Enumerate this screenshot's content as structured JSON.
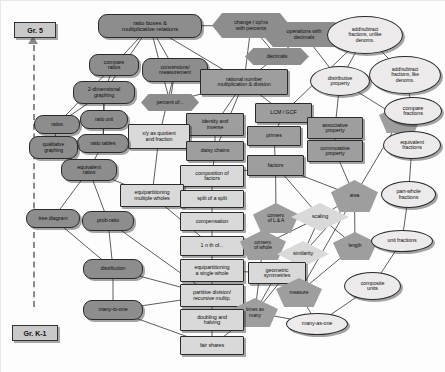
{
  "diagram": {
    "axis": {
      "top_label": "Gr. 5",
      "bottom_label": "Gr. K-1",
      "direction": "upward"
    },
    "colors": {
      "dark_node": "#8d8d8d",
      "mid_node": "#9e9e9e",
      "light_node": "#d9d9d9",
      "pale_node": "#eceaea",
      "edge": "#333333",
      "background": "#fdfdfd"
    },
    "nodes": [
      {
        "id": "ratio-boxes",
        "label": "ratio boxes &\nmultiplicative relations",
        "shape": "round",
        "fill": "dark",
        "x": 98,
        "y": 14,
        "w": 104,
        "h": 24
      },
      {
        "id": "change-ops-percents",
        "label": "change / op'ns\nwith percents",
        "shape": "hex",
        "fill": "dark",
        "x": 212,
        "y": 13,
        "w": 78,
        "h": 25
      },
      {
        "id": "operations-with-decimals",
        "label": "operations with\ndecimals",
        "shape": "hex",
        "fill": "dark",
        "x": 262,
        "y": 22,
        "w": 84,
        "h": 25
      },
      {
        "id": "addsub-unlike",
        "label": "add/subtract\nfractions, unlike\ndenoms.",
        "shape": "oval",
        "fill": "pale",
        "x": 327,
        "y": 16,
        "w": 76,
        "h": 38
      },
      {
        "id": "compare-ratios",
        "label": "compare\nratios",
        "shape": "round",
        "fill": "dark",
        "x": 89,
        "y": 54,
        "w": 50,
        "h": 22
      },
      {
        "id": "conversions-measurement",
        "label": "conversions/\nmeasurement",
        "shape": "round",
        "fill": "dark",
        "x": 142,
        "y": 58,
        "w": 66,
        "h": 24
      },
      {
        "id": "decimals",
        "label": "decimals",
        "shape": "hex",
        "fill": "dark",
        "x": 245,
        "y": 48,
        "w": 64,
        "h": 17
      },
      {
        "id": "addsub-like",
        "label": "add/subtract\nfractions, like\ndenoms.",
        "shape": "oval",
        "fill": "pale",
        "x": 369,
        "y": 56,
        "w": 72,
        "h": 38
      },
      {
        "id": "2d-graphing",
        "label": "2-dimensional\ngraphing",
        "shape": "round",
        "fill": "dark",
        "x": 73,
        "y": 81,
        "w": 62,
        "h": 23
      },
      {
        "id": "percent-of",
        "label": "percent of...",
        "shape": "hex",
        "fill": "dark",
        "x": 141,
        "y": 94,
        "w": 58,
        "h": 17
      },
      {
        "id": "rational-number-mult-div",
        "label": "rational number\nmultiplication & division",
        "shape": "rect",
        "fill": "mid",
        "x": 200,
        "y": 69,
        "w": 88,
        "h": 26
      },
      {
        "id": "distributive-property",
        "label": "distributive\nproperty",
        "shape": "oval",
        "fill": "pale",
        "x": 310,
        "y": 66,
        "w": 60,
        "h": 30
      },
      {
        "id": "ratios",
        "label": "ratios",
        "shape": "round",
        "fill": "dark",
        "x": 34,
        "y": 115,
        "w": 46,
        "h": 19
      },
      {
        "id": "ratio-unit",
        "label": "ratio unit",
        "shape": "round",
        "fill": "dark",
        "x": 80,
        "y": 110,
        "w": 48,
        "h": 19
      },
      {
        "id": "identity-and-inverse",
        "label": "identity and\ninverse",
        "shape": "rect",
        "fill": "mid",
        "x": 186,
        "y": 113,
        "w": 58,
        "h": 23
      },
      {
        "id": "lcm-gcf",
        "label": "LCM / GCF",
        "shape": "rect",
        "fill": "mid",
        "x": 255,
        "y": 103,
        "w": 57,
        "h": 20
      },
      {
        "id": "volume",
        "label": "volume",
        "shape": "pent",
        "fill": "mid",
        "x": 379,
        "y": 104,
        "w": 43,
        "h": 29
      },
      {
        "id": "compare-fractions",
        "label": "compare\nfractions",
        "shape": "oval",
        "fill": "pale",
        "x": 384,
        "y": 97,
        "w": 58,
        "h": 28
      },
      {
        "id": "xy-quotient-fraction",
        "label": "x/y as quotient\nand fraction",
        "shape": "rect",
        "fill": "light",
        "x": 128,
        "y": 124,
        "w": 62,
        "h": 25
      },
      {
        "id": "ratio-tables",
        "label": "ratio tables",
        "shape": "round",
        "fill": "dark",
        "x": 77,
        "y": 134,
        "w": 52,
        "h": 19
      },
      {
        "id": "qualitative-graphing",
        "label": "qualitative\ngraphing",
        "shape": "round",
        "fill": "dark",
        "x": 29,
        "y": 136,
        "w": 49,
        "h": 23
      },
      {
        "id": "associative-property",
        "label": "associative\nproperty",
        "shape": "rect",
        "fill": "mid",
        "x": 307,
        "y": 117,
        "w": 56,
        "h": 22
      },
      {
        "id": "commutative-property",
        "label": "commutative\nproperty",
        "shape": "rect",
        "fill": "mid",
        "x": 307,
        "y": 140,
        "w": 56,
        "h": 22
      },
      {
        "id": "primes",
        "label": "primes",
        "shape": "rect",
        "fill": "mid",
        "x": 247,
        "y": 126,
        "w": 54,
        "h": 20
      },
      {
        "id": "daisy-chains",
        "label": "daisy chains",
        "shape": "rect",
        "fill": "mid",
        "x": 186,
        "y": 141,
        "w": 58,
        "h": 20
      },
      {
        "id": "equivalent-fractions",
        "label": "equivalent\nfractions",
        "shape": "oval",
        "fill": "pale",
        "x": 383,
        "y": 131,
        "w": 58,
        "h": 28
      },
      {
        "id": "equivalent-ratios",
        "label": "equivalent\nratios",
        "shape": "round",
        "fill": "dark",
        "x": 61,
        "y": 159,
        "w": 56,
        "h": 22
      },
      {
        "id": "factors",
        "label": "factors",
        "shape": "rect",
        "fill": "mid",
        "x": 247,
        "y": 155,
        "w": 57,
        "h": 21
      },
      {
        "id": "composition-of-factors",
        "label": "composition of\nfactors",
        "shape": "rect",
        "fill": "light",
        "x": 180,
        "y": 165,
        "w": 64,
        "h": 22
      },
      {
        "id": "area",
        "label": "area",
        "shape": "pent",
        "fill": "mid",
        "x": 331,
        "y": 180,
        "w": 47,
        "h": 32
      },
      {
        "id": "part-whole-fractions",
        "label": "part-whole\nfractions",
        "shape": "oval",
        "fill": "pale",
        "x": 381,
        "y": 181,
        "w": 55,
        "h": 27
      },
      {
        "id": "equipart-multiple-wholes",
        "label": "equipartitioning\nmultiple wholes",
        "shape": "rect",
        "fill": "light",
        "x": 120,
        "y": 184,
        "w": 64,
        "h": 23
      },
      {
        "id": "split-of-a-split",
        "label": "split of a split",
        "shape": "rect",
        "fill": "light",
        "x": 180,
        "y": 190,
        "w": 64,
        "h": 18
      },
      {
        "id": "conserv-l-a",
        "label": "conserv.\nof L & A",
        "shape": "pent",
        "fill": "mid",
        "x": 253,
        "y": 203,
        "w": 46,
        "h": 30
      },
      {
        "id": "compensation",
        "label": "compensation",
        "shape": "rect",
        "fill": "light",
        "x": 180,
        "y": 212,
        "w": 64,
        "h": 19
      },
      {
        "id": "scaling",
        "label": "scaling",
        "shape": "diam",
        "fill": "light",
        "x": 291,
        "y": 203,
        "w": 58,
        "h": 28
      },
      {
        "id": "tree-diagram",
        "label": "tree diagram",
        "shape": "round",
        "fill": "dark",
        "x": 26,
        "y": 209,
        "w": 54,
        "h": 19
      },
      {
        "id": "prob-ratio",
        "label": "prob-ratio",
        "shape": "round",
        "fill": "dark",
        "x": 82,
        "y": 211,
        "w": 52,
        "h": 20
      },
      {
        "id": "one-nth-of",
        "label": "1 n th of...",
        "shape": "rect",
        "fill": "light",
        "x": 180,
        "y": 236,
        "w": 64,
        "h": 20
      },
      {
        "id": "conserv-of-whole",
        "label": "conserv.\nof whole",
        "shape": "pent",
        "fill": "mid",
        "x": 240,
        "y": 230,
        "w": 46,
        "h": 30
      },
      {
        "id": "length",
        "label": "length",
        "shape": "pent",
        "fill": "mid",
        "x": 333,
        "y": 232,
        "w": 44,
        "h": 28
      },
      {
        "id": "similarity",
        "label": "similarity",
        "shape": "diam",
        "fill": "light",
        "x": 277,
        "y": 241,
        "w": 52,
        "h": 26
      },
      {
        "id": "unit-fractions",
        "label": "unit fractions",
        "shape": "oval",
        "fill": "pale",
        "x": 371,
        "y": 230,
        "w": 62,
        "h": 22
      },
      {
        "id": "equipart-single-whole",
        "label": "equipartitioning\na single whole",
        "shape": "rect",
        "fill": "light",
        "x": 180,
        "y": 259,
        "w": 64,
        "h": 23
      },
      {
        "id": "geometric-symmetries",
        "label": "geometric\nsymmetries",
        "shape": "rect",
        "fill": "light",
        "x": 248,
        "y": 262,
        "w": 58,
        "h": 22
      },
      {
        "id": "distribution",
        "label": "distribution",
        "shape": "round",
        "fill": "dark",
        "x": 83,
        "y": 259,
        "w": 60,
        "h": 20
      },
      {
        "id": "measure",
        "label": "measure",
        "shape": "pent",
        "fill": "mid",
        "x": 276,
        "y": 278,
        "w": 46,
        "h": 29
      },
      {
        "id": "composite-units",
        "label": "composite\nunits",
        "shape": "oval",
        "fill": "pale",
        "x": 344,
        "y": 272,
        "w": 57,
        "h": 28
      },
      {
        "id": "partitive-division",
        "label": "partitive division/\nrecursive multip.",
        "shape": "rect",
        "fill": "light",
        "x": 180,
        "y": 284,
        "w": 64,
        "h": 23
      },
      {
        "id": "times-as-many",
        "label": "times as\nmany",
        "shape": "pent",
        "fill": "mid",
        "x": 232,
        "y": 298,
        "w": 46,
        "h": 29
      },
      {
        "id": "many-to-one",
        "label": "many-to-one",
        "shape": "round",
        "fill": "dark",
        "x": 83,
        "y": 300,
        "w": 60,
        "h": 20
      },
      {
        "id": "doubling-and-halving",
        "label": "doubling and\nhalving",
        "shape": "rect",
        "fill": "light",
        "x": 180,
        "y": 309,
        "w": 64,
        "h": 22
      },
      {
        "id": "many-as-one",
        "label": "many-as-one",
        "shape": "oval",
        "fill": "pale",
        "x": 286,
        "y": 313,
        "w": 62,
        "h": 22
      },
      {
        "id": "fair-shares",
        "label": "fair shares",
        "shape": "rect",
        "fill": "light",
        "x": 180,
        "y": 336,
        "w": 64,
        "h": 19
      }
    ],
    "edges": [
      [
        "ratio-boxes",
        "compare-ratios"
      ],
      [
        "ratio-boxes",
        "conversions-measurement"
      ],
      [
        "ratio-boxes",
        "2d-graphing"
      ],
      [
        "ratio-boxes",
        "change-ops-percents"
      ],
      [
        "ratio-boxes",
        "rational-number-mult-div"
      ],
      [
        "ratio-boxes",
        "percent-of"
      ],
      [
        "change-ops-percents",
        "decimals"
      ],
      [
        "change-ops-percents",
        "rational-number-mult-div"
      ],
      [
        "operations-with-decimals",
        "decimals"
      ],
      [
        "operations-with-decimals",
        "addsub-unlike"
      ],
      [
        "operations-with-decimals",
        "distributive-property"
      ],
      [
        "addsub-unlike",
        "addsub-like"
      ],
      [
        "addsub-unlike",
        "distributive-property"
      ],
      [
        "addsub-unlike",
        "lcm-gcf"
      ],
      [
        "addsub-like",
        "compare-fractions"
      ],
      [
        "compare-fractions",
        "equivalent-fractions"
      ],
      [
        "equivalent-fractions",
        "part-whole-fractions"
      ],
      [
        "part-whole-fractions",
        "unit-fractions"
      ],
      [
        "unit-fractions",
        "composite-units"
      ],
      [
        "compare-ratios",
        "2d-graphing"
      ],
      [
        "compare-ratios",
        "ratios"
      ],
      [
        "conversions-measurement",
        "percent-of"
      ],
      [
        "conversions-measurement",
        "rational-number-mult-div"
      ],
      [
        "conversions-measurement",
        "xy-quotient-fraction"
      ],
      [
        "decimals",
        "rational-number-mult-div"
      ],
      [
        "rational-number-mult-div",
        "identity-and-inverse"
      ],
      [
        "rational-number-mult-div",
        "lcm-gcf"
      ],
      [
        "rational-number-mult-div",
        "percent-of"
      ],
      [
        "rational-number-mult-div",
        "daisy-chains"
      ],
      [
        "distributive-property",
        "associative-property"
      ],
      [
        "distributive-property",
        "volume"
      ],
      [
        "2d-graphing",
        "ratios"
      ],
      [
        "2d-graphing",
        "ratio-unit"
      ],
      [
        "2d-graphing",
        "ratio-tables"
      ],
      [
        "ratios",
        "qualitative-graphing"
      ],
      [
        "ratios",
        "ratio-unit"
      ],
      [
        "ratio-unit",
        "ratio-tables"
      ],
      [
        "ratio-tables",
        "equivalent-ratios"
      ],
      [
        "qualitative-graphing",
        "equivalent-ratios"
      ],
      [
        "identity-and-inverse",
        "daisy-chains"
      ],
      [
        "lcm-gcf",
        "primes"
      ],
      [
        "primes",
        "factors"
      ],
      [
        "associative-property",
        "commutative-property"
      ],
      [
        "commutative-property",
        "area"
      ],
      [
        "daisy-chains",
        "composition-of-factors"
      ],
      [
        "composition-of-factors",
        "split-of-a-split"
      ],
      [
        "composition-of-factors",
        "factors"
      ],
      [
        "factors",
        "conserv-l-a"
      ],
      [
        "factors",
        "area"
      ],
      [
        "factors",
        "scaling"
      ],
      [
        "volume",
        "area"
      ],
      [
        "volume",
        "equivalent-fractions"
      ],
      [
        "equivalent-ratios",
        "equipart-multiple-wholes"
      ],
      [
        "equivalent-ratios",
        "tree-diagram"
      ],
      [
        "equivalent-ratios",
        "prob-ratio"
      ],
      [
        "xy-quotient-fraction",
        "equipart-multiple-wholes"
      ],
      [
        "split-of-a-split",
        "compensation"
      ],
      [
        "compensation",
        "one-nth-of"
      ],
      [
        "conserv-l-a",
        "conserv-of-whole"
      ],
      [
        "conserv-l-a",
        "scaling"
      ],
      [
        "scaling",
        "similarity"
      ],
      [
        "scaling",
        "length"
      ],
      [
        "scaling",
        "conserv-of-whole"
      ],
      [
        "area",
        "scaling"
      ],
      [
        "area",
        "similarity"
      ],
      [
        "area",
        "length"
      ],
      [
        "area",
        "measure"
      ],
      [
        "one-nth-of",
        "equipart-single-whole"
      ],
      [
        "equipart-multiple-wholes",
        "one-nth-of"
      ],
      [
        "equipart-single-whole",
        "partitive-division"
      ],
      [
        "equipart-single-whole",
        "geometric-symmetries"
      ],
      [
        "geometric-symmetries",
        "similarity"
      ],
      [
        "geometric-symmetries",
        "times-as-many"
      ],
      [
        "similarity",
        "times-as-many"
      ],
      [
        "length",
        "measure"
      ],
      [
        "length",
        "unit-fractions"
      ],
      [
        "measure",
        "many-as-one"
      ],
      [
        "composite-units",
        "many-as-one"
      ],
      [
        "tree-diagram",
        "distribution"
      ],
      [
        "prob-ratio",
        "distribution"
      ],
      [
        "prob-ratio",
        "partitive-division"
      ],
      [
        "distribution",
        "many-to-one"
      ],
      [
        "distribution",
        "partitive-division"
      ],
      [
        "partitive-division",
        "doubling-and-halving"
      ],
      [
        "partitive-division",
        "many-to-one"
      ],
      [
        "doubling-and-halving",
        "fair-shares"
      ],
      [
        "doubling-and-halving",
        "times-as-many"
      ],
      [
        "many-to-one",
        "fair-shares"
      ],
      [
        "fair-shares",
        "times-as-many"
      ],
      [
        "conserv-of-whole",
        "times-as-many"
      ],
      [
        "times-as-many",
        "many-as-one"
      ]
    ]
  }
}
